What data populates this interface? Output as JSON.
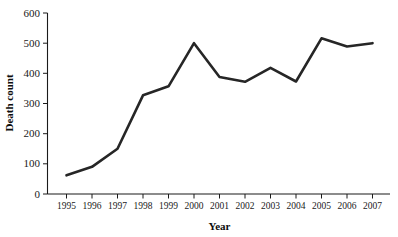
{
  "chart_data": {
    "type": "line",
    "title": "",
    "xlabel": "Year",
    "ylabel": "Death count",
    "categories": [
      "1995",
      "1996",
      "1997",
      "1998",
      "1999",
      "2000",
      "2001",
      "2002",
      "2003",
      "2004",
      "2005",
      "2006",
      "2007"
    ],
    "values": [
      62,
      90,
      150,
      327,
      357,
      500,
      388,
      372,
      418,
      373,
      516,
      489,
      500
    ],
    "series": [
      {
        "name": "Death count",
        "values": [
          62,
          90,
          150,
          327,
          357,
          500,
          388,
          372,
          418,
          373,
          516,
          489,
          500
        ]
      }
    ],
    "x": [
      1995,
      1996,
      1997,
      1998,
      1999,
      2000,
      2001,
      2002,
      2003,
      2004,
      2005,
      2006,
      2007
    ],
    "ylim": [
      0,
      600
    ],
    "xlim": [
      1995,
      2007
    ],
    "yticks": [
      0,
      100,
      200,
      300,
      400,
      500,
      600
    ],
    "ytick_labels": [
      "0",
      "100",
      "200",
      "300",
      "400",
      "500",
      "600"
    ],
    "xtick_labels": [
      "1995",
      "1996",
      "1997",
      "1998",
      "1999",
      "2000",
      "2001",
      "2002",
      "2003",
      "2004",
      "2005",
      "2006",
      "2007"
    ],
    "grid": false,
    "legend": false,
    "legend_position": "none",
    "line_color": "#262626",
    "axis_color": "#1a1a1a"
  },
  "axes": {
    "y_title": "Death count",
    "x_title": "Year"
  }
}
